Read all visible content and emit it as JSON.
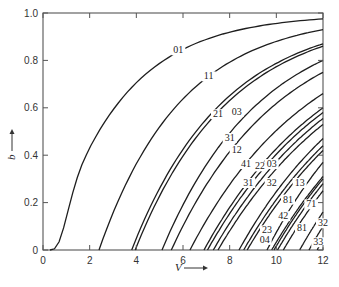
{
  "chart_data": {
    "type": "line",
    "title": "",
    "xlabel": "V",
    "ylabel": "b",
    "xlim": [
      0,
      12
    ],
    "ylim": [
      0,
      1.0
    ],
    "grid": false,
    "legend": "inline curve labels",
    "x_ticks": [
      "0",
      "2",
      "4",
      "6",
      "8",
      "10",
      "12"
    ],
    "y_ticks": [
      "0",
      "0.2",
      "0.4",
      "0.6",
      "0.8",
      "1.0"
    ],
    "series": [
      {
        "name": "01",
        "v_cutoff": 0.3,
        "b_at_12": 0.975,
        "label_at": [
          5.8,
          0.83
        ]
      },
      {
        "name": "11",
        "v_cutoff": 2.4,
        "b_at_12": 0.93,
        "label_at": [
          7.1,
          0.72
        ]
      },
      {
        "name": "21",
        "v_cutoff": 3.8,
        "b_at_12": 0.87,
        "label_at": [
          7.5,
          0.56
        ]
      },
      {
        "name": "03",
        "v_cutoff": 3.95,
        "b_at_12": 0.86,
        "label_at": [
          8.3,
          0.57
        ]
      },
      {
        "name": "31",
        "v_cutoff": 5.1,
        "b_at_12": 0.8,
        "label_at": [
          8.0,
          0.46
        ]
      },
      {
        "name": "12",
        "v_cutoff": 5.5,
        "b_at_12": 0.75,
        "label_at": [
          8.3,
          0.41
        ]
      },
      {
        "name": "41",
        "v_cutoff": 6.3,
        "b_at_12": 0.66,
        "label_at": [
          8.7,
          0.35
        ]
      },
      {
        "name": "22",
        "v_cutoff": 6.9,
        "b_at_12": 0.6,
        "label_at": [
          9.3,
          0.34
        ]
      },
      {
        "name": "03",
        "v_cutoff": 7.05,
        "b_at_12": 0.58,
        "label_at": [
          9.8,
          0.35
        ]
      },
      {
        "name": "51",
        "v_cutoff": 7.3,
        "b_at_12": 0.555,
        "label_at": null
      },
      {
        "name": "31",
        "v_cutoff": 7.5,
        "b_at_12": 0.53,
        "label_at": [
          8.8,
          0.27
        ]
      },
      {
        "name": "61",
        "v_cutoff": 8.4,
        "b_at_12": 0.47,
        "label_at": null
      },
      {
        "name": "32",
        "v_cutoff": 8.6,
        "b_at_12": 0.44,
        "label_at": [
          9.8,
          0.27
        ]
      },
      {
        "name": "13",
        "v_cutoff": 8.75,
        "b_at_12": 0.42,
        "label_at": [
          11.0,
          0.27
        ]
      },
      {
        "name": "81",
        "v_cutoff": 9.6,
        "b_at_12": 0.37,
        "label_at": [
          10.5,
          0.2
        ]
      },
      {
        "name": "42",
        "v_cutoff": 9.8,
        "b_at_12": 0.31,
        "label_at": [
          10.3,
          0.13
        ]
      },
      {
        "name": "23",
        "v_cutoff": 9.9,
        "b_at_12": 0.3,
        "label_at": [
          9.6,
          0.07
        ]
      },
      {
        "name": "04",
        "v_cutoff": 10.05,
        "b_at_12": 0.28,
        "label_at": [
          9.5,
          0.03
        ]
      },
      {
        "name": "71",
        "v_cutoff": 10.3,
        "b_at_12": 0.25,
        "label_at": [
          11.5,
          0.18
        ]
      },
      {
        "name": "81",
        "v_cutoff": 11.0,
        "b_at_12": 0.16,
        "label_at": [
          11.1,
          0.08
        ]
      },
      {
        "name": "32",
        "v_cutoff": 11.4,
        "b_at_12": 0.1,
        "label_at": [
          12.0,
          0.1
        ]
      },
      {
        "name": "33",
        "v_cutoff": 11.75,
        "b_at_12": 0.045,
        "label_at": [
          11.8,
          0.02
        ]
      }
    ]
  },
  "axes": {
    "x_title": "V",
    "y_title": "b"
  }
}
